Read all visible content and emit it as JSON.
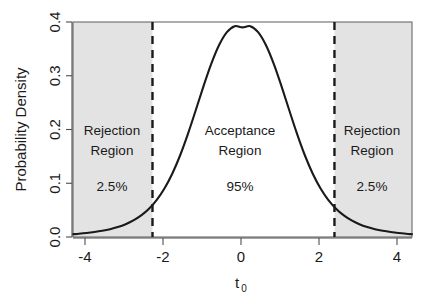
{
  "chart_data": {
    "type": "line",
    "title": "",
    "subtitle": "",
    "xlabel": "t_0",
    "xlabel_base": "t",
    "xlabel_sub": "0",
    "ylabel": "Probability Density",
    "xlim": [
      -4.35,
      4.35
    ],
    "ylim": [
      0.0,
      0.4
    ],
    "xticks": [
      -4,
      -2,
      0,
      2,
      4
    ],
    "xtick_labels": [
      "-4",
      "-2",
      "0",
      "2",
      "4"
    ],
    "yticks": [
      0.0,
      0.1,
      0.2,
      0.3,
      0.4
    ],
    "ytick_labels": [
      "0.0",
      "0.1",
      "0.2",
      "0.3",
      "0.4"
    ],
    "grid": false,
    "legend": "none",
    "curve_name": "t-distribution density",
    "distribution": "Student t",
    "peak_x": 0,
    "peak_y": 0.39,
    "x": [
      -4.35,
      -4.2,
      -4,
      -3.8,
      -3.6,
      -3.4,
      -3.2,
      -3,
      -2.8,
      -2.6,
      -2.4,
      -2.2,
      -2,
      -1.8,
      -1.6,
      -1.4,
      -1.2,
      -1,
      -0.8,
      -0.6,
      -0.4,
      -0.2,
      0,
      0.2,
      0.4,
      0.6,
      0.8,
      1,
      1.2,
      1.4,
      1.6,
      1.8,
      2,
      2.2,
      2.4,
      2.6,
      2.8,
      3,
      3.2,
      3.4,
      3.6,
      3.8,
      4,
      4.2,
      4.35
    ],
    "y": [
      0.0052,
      0.006,
      0.0074,
      0.0092,
      0.0115,
      0.0145,
      0.0185,
      0.0238,
      0.0308,
      0.0401,
      0.0526,
      0.0691,
      0.0907,
      0.1182,
      0.1521,
      0.1919,
      0.2358,
      0.2807,
      0.3226,
      0.3572,
      0.3811,
      0.3923,
      0.39,
      0.3923,
      0.3811,
      0.3572,
      0.3226,
      0.2807,
      0.2358,
      0.1919,
      0.1521,
      0.1182,
      0.0907,
      0.0691,
      0.0526,
      0.0401,
      0.0308,
      0.0238,
      0.0185,
      0.0145,
      0.0115,
      0.0092,
      0.0074,
      0.006,
      0.0052
    ],
    "critical_values": [
      -2.31,
      2.36
    ],
    "critical_line_style": "dashed",
    "shaded_regions": [
      {
        "name": "left-rejection-region",
        "from": -4.35,
        "to": -2.31,
        "color": "#e3e3e3"
      },
      {
        "name": "right-rejection-region",
        "from": 2.36,
        "to": 4.35,
        "color": "#e3e3e3"
      }
    ],
    "annotations": [
      {
        "name": "left-rejection",
        "line1": "Rejection",
        "line2": "Region",
        "percent": "2.5%",
        "x": -3.1
      },
      {
        "name": "acceptance",
        "line1": "Acceptance",
        "line2": "Region",
        "percent": "95%",
        "x": 0
      },
      {
        "name": "right-rejection",
        "line1": "Rejection",
        "line2": "Region",
        "percent": "2.5%",
        "x": 3.15
      }
    ],
    "colors": {
      "curve": "#1a1a1a",
      "shading": "#e3e3e3",
      "axis": "#4d4d4d",
      "text": "#1a1a1a",
      "background": "#ffffff"
    }
  },
  "labels": {
    "ylabel": "Probability Density",
    "xlabel_base": "t",
    "xlabel_sub": "0",
    "ytick_0": "0.0",
    "ytick_1": "0.1",
    "ytick_2": "0.2",
    "ytick_3": "0.3",
    "ytick_4": "0.4",
    "xtick_0": "-4",
    "xtick_1": "-2",
    "xtick_2": "0",
    "xtick_3": "2",
    "xtick_4": "4",
    "left_region_line1": "Rejection",
    "left_region_line2": "Region",
    "left_region_pct": "2.5%",
    "center_region_line1": "Acceptance",
    "center_region_line2": "Region",
    "center_region_pct": "95%",
    "right_region_line1": "Rejection",
    "right_region_line2": "Region",
    "right_region_pct": "2.5%"
  }
}
